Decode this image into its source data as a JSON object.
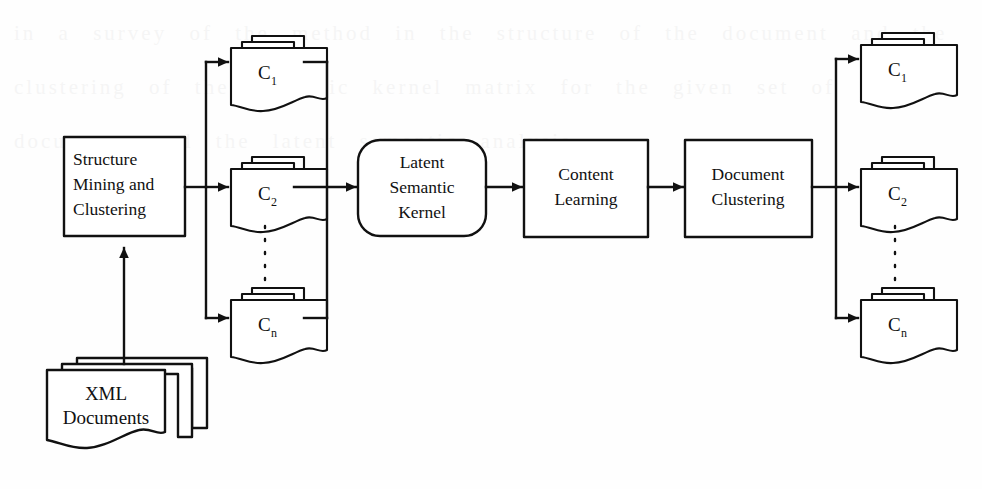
{
  "figure": {
    "type": "flow-diagram",
    "background_color": "#fefefe",
    "line_color": "#111111",
    "shape_fill": "#ffffff"
  },
  "nodes": {
    "input_documents": {
      "label_line1": "XML",
      "label_line2": "Documents",
      "shape": "document-stack"
    },
    "structure_mining": {
      "label_line1": "Structure",
      "label_line2": "Mining and",
      "label_line3": "Clustering",
      "shape": "rectangle"
    },
    "latent_semantic_kernel": {
      "label_line1": "Latent",
      "label_line2": "Semantic",
      "label_line3": "Kernel",
      "shape": "rounded-rectangle"
    },
    "content_learning": {
      "label_line1": "Content",
      "label_line2": "Learning",
      "shape": "rectangle"
    },
    "document_clustering": {
      "label_line1": "Document",
      "label_line2": "Clustering",
      "shape": "rectangle"
    }
  },
  "structure_clusters": {
    "group_label": "structure clusters",
    "items": [
      {
        "base": "C",
        "sub": "1"
      },
      {
        "base": "C",
        "sub": "2"
      },
      {
        "base": "C",
        "sub": "n"
      }
    ],
    "ellipsis": "vertical-dotted"
  },
  "output_clusters": {
    "group_label": "document clusters",
    "items": [
      {
        "base": "C",
        "sub": "1"
      },
      {
        "base": "C",
        "sub": "2"
      },
      {
        "base": "C",
        "sub": "n"
      }
    ],
    "ellipsis": "vertical-dotted"
  },
  "connections": [
    {
      "from": "input_documents",
      "to": "structure_mining",
      "style": "solid-arrow",
      "direction": "up"
    },
    {
      "from": "structure_mining",
      "to": "structure_clusters",
      "style": "solid-arrow-fanout",
      "direction": "right"
    },
    {
      "from": "structure_clusters",
      "to": "latent_semantic_kernel",
      "style": "solid-arrow-fanin",
      "direction": "right"
    },
    {
      "from": "latent_semantic_kernel",
      "to": "content_learning",
      "style": "solid-arrow",
      "direction": "right"
    },
    {
      "from": "content_learning",
      "to": "document_clustering",
      "style": "solid-arrow",
      "direction": "right"
    },
    {
      "from": "document_clustering",
      "to": "output_clusters",
      "style": "solid-arrow-fanout",
      "direction": "right"
    }
  ],
  "page_bleed_text": "in a survey of the method in the structure of the document and the clustering of the semantic kernel matrix for the given set of documents and the latent semantic analysis"
}
